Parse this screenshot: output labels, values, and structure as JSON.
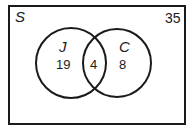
{
  "diagram": {
    "type": "venn",
    "universal_set": {
      "label": "S",
      "outside_count": "35"
    },
    "sets": [
      {
        "label": "J",
        "only_count": "19"
      },
      {
        "label": "C",
        "only_count": "8"
      }
    ],
    "intersection": {
      "sets": [
        "J",
        "C"
      ],
      "count": "4"
    },
    "colors": {
      "stroke": "#1a1a1a",
      "background": "#ffffff"
    }
  }
}
